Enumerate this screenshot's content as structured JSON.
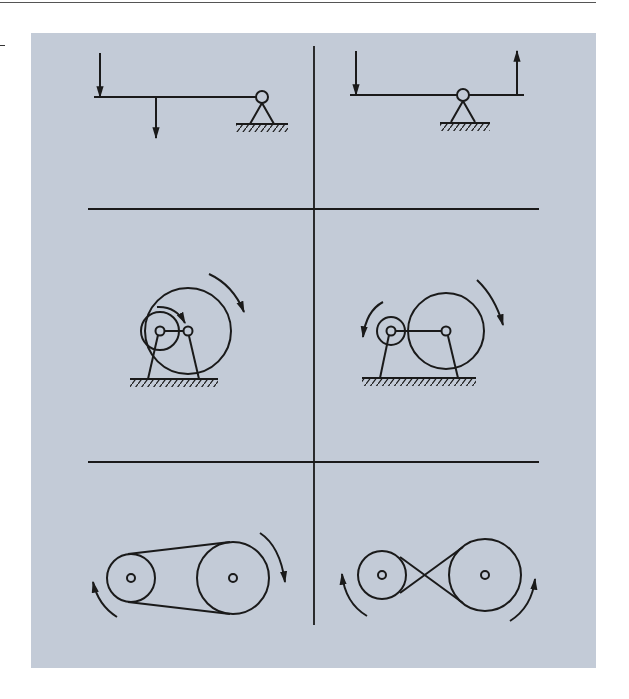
{
  "figure": {
    "background_color": "#c3cbd7",
    "line_color": "#1a1a1a",
    "panels": [
      {
        "id": "lever-class-2",
        "row": 1,
        "col": 1,
        "type": "lever",
        "fulcrum": "end",
        "forces": [
          "down-at-left-end",
          "down-at-middle"
        ]
      },
      {
        "id": "lever-class-1",
        "row": 1,
        "col": 2,
        "type": "lever",
        "fulcrum": "center",
        "forces": [
          "down-at-left-end",
          "up-at-right-end"
        ]
      },
      {
        "id": "internal-wheel-drive",
        "row": 2,
        "col": 1,
        "type": "internal-gear",
        "rotation": [
          "small-clockwise",
          "large-clockwise"
        ]
      },
      {
        "id": "external-wheel-drive",
        "row": 2,
        "col": 2,
        "type": "external-gear",
        "rotation": [
          "small-counterclockwise",
          "large-clockwise"
        ]
      },
      {
        "id": "open-belt-drive",
        "row": 3,
        "col": 1,
        "type": "open-belt",
        "rotation": [
          "small-clockwise",
          "large-clockwise"
        ]
      },
      {
        "id": "crossed-belt-drive",
        "row": 3,
        "col": 2,
        "type": "crossed-belt",
        "rotation": [
          "small-clockwise",
          "large-counterclockwise"
        ]
      }
    ]
  }
}
